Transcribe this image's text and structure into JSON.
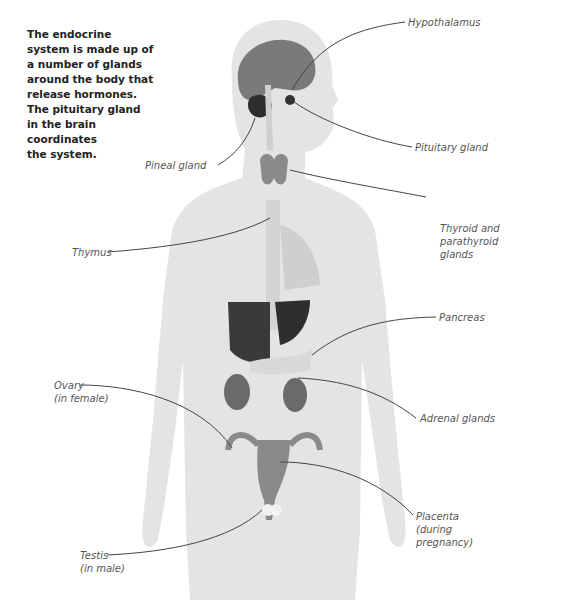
{
  "intro_text": {
    "lines": [
      "The endocrine",
      "system is made up of",
      "a number of glands",
      "around the body that",
      "release hormones.",
      "The pituitary gland",
      "in the brain",
      "coordinates",
      "the system."
    ]
  },
  "labels": {
    "hypothalamus": [
      "Hypothalamus"
    ],
    "pituitary": [
      "Pituitary gland"
    ],
    "pineal": [
      "Pineal gland"
    ],
    "thyroid": [
      "Thyroid and",
      "parathyroid",
      "glands"
    ],
    "thymus": [
      "Thymus"
    ],
    "pancreas": [
      "Pancreas"
    ],
    "ovary": [
      "Ovary",
      "(in female)"
    ],
    "adrenal": [
      "Adrenal glands"
    ],
    "placenta": [
      "Placenta",
      "(during",
      "pregnancy)"
    ],
    "testis": [
      "Testis",
      "(in male)"
    ]
  },
  "colors": {
    "body": "#e3e3e3",
    "organ_dark": "#3a3a3a",
    "organ_mid": "#7a7a7a",
    "leader": "#444444",
    "label_text": "#555555"
  }
}
